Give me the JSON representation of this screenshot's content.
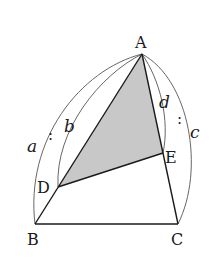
{
  "figure": {
    "type": "geometry",
    "colors": {
      "shade": "#c8c8c8",
      "stroke": "#1a1a1a",
      "arc": "#555555"
    },
    "points": {
      "A": {
        "label": "A",
        "x": 142,
        "y": 54
      },
      "B": {
        "label": "B",
        "x": 35,
        "y": 224
      },
      "C": {
        "label": "C",
        "x": 178,
        "y": 224
      },
      "D": {
        "label": "D",
        "x": 58,
        "y": 187
      },
      "E": {
        "label": "E",
        "x": 163,
        "y": 153
      }
    },
    "shaded_region": [
      "A",
      "D",
      "E"
    ],
    "segments": [
      [
        "A",
        "B"
      ],
      [
        "B",
        "C"
      ],
      [
        "C",
        "A"
      ],
      [
        "D",
        "E"
      ]
    ],
    "ratio_left": {
      "a": "a",
      "colon": ":",
      "b": "b",
      "meaning": "AB : AD = a : b"
    },
    "ratio_right": {
      "d": "d",
      "colon": ":",
      "c": "c",
      "meaning": "AE : AC = d : c"
    }
  }
}
